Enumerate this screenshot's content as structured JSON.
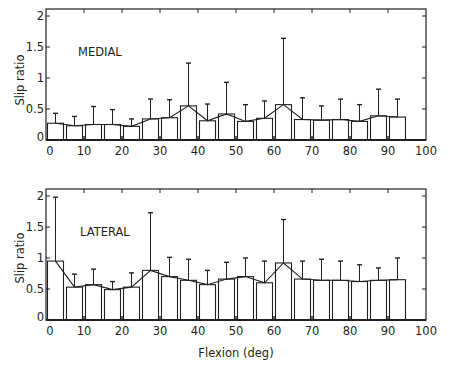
{
  "figure": {
    "xlabel": "Flexion (deg)"
  },
  "chart_data": [
    {
      "type": "bar",
      "panel_label": "MEDIAL",
      "title": "",
      "xlabel": "",
      "ylabel": "Slip ratio",
      "xlim": [
        0,
        100
      ],
      "ylim": [
        0,
        2
      ],
      "xticks": [
        "0",
        "10",
        "20",
        "30",
        "40",
        "50",
        "60",
        "70",
        "80",
        "90",
        "100"
      ],
      "yticks": [
        "0",
        "0.5",
        "1",
        "1.5",
        "2"
      ],
      "grid": false,
      "legend": null,
      "bin_width_deg": 5,
      "categories": [
        "0-5",
        "5-10",
        "10-15",
        "15-20",
        "20-25",
        "25-30",
        "30-35",
        "35-40",
        "40-45",
        "45-50",
        "50-55",
        "55-60",
        "60-65",
        "65-70",
        "70-75",
        "75-80",
        "80-85",
        "85-90",
        "90-95"
      ],
      "x_centers": [
        2.5,
        7.5,
        12.5,
        17.5,
        22.5,
        27.5,
        32.5,
        37.5,
        42.5,
        47.5,
        52.5,
        57.5,
        62.5,
        67.5,
        72.5,
        77.5,
        82.5,
        87.5,
        92.5
      ],
      "series": [
        {
          "name": "mean",
          "values": [
            0.27,
            0.23,
            0.25,
            0.25,
            0.22,
            0.34,
            0.36,
            0.55,
            0.31,
            0.42,
            0.3,
            0.35,
            0.57,
            0.33,
            0.32,
            0.33,
            0.3,
            0.39,
            0.37
          ]
        },
        {
          "name": "mean_plus_sd",
          "values": [
            0.43,
            0.38,
            0.54,
            0.49,
            0.34,
            0.66,
            0.65,
            1.24,
            0.58,
            0.93,
            0.57,
            0.63,
            1.64,
            0.68,
            0.55,
            0.66,
            0.57,
            0.82,
            0.66
          ]
        }
      ],
      "overlay": "line connecting bar-top means"
    },
    {
      "type": "bar",
      "panel_label": "LATERAL",
      "title": "",
      "xlabel": "Flexion (deg)",
      "ylabel": "Slip ratio",
      "xlim": [
        0,
        100
      ],
      "ylim": [
        0,
        2
      ],
      "xticks": [
        "0",
        "10",
        "20",
        "30",
        "40",
        "50",
        "60",
        "70",
        "80",
        "90",
        "100"
      ],
      "yticks": [
        "0",
        "0.5",
        "1",
        "1.5",
        "2"
      ],
      "grid": false,
      "legend": null,
      "bin_width_deg": 5,
      "categories": [
        "0-5",
        "5-10",
        "10-15",
        "15-20",
        "20-25",
        "25-30",
        "30-35",
        "35-40",
        "40-45",
        "45-50",
        "50-55",
        "55-60",
        "60-65",
        "65-70",
        "70-75",
        "75-80",
        "80-85",
        "85-90",
        "90-95"
      ],
      "x_centers": [
        2.5,
        7.5,
        12.5,
        17.5,
        22.5,
        27.5,
        32.5,
        37.5,
        42.5,
        47.5,
        52.5,
        57.5,
        62.5,
        67.5,
        72.5,
        77.5,
        82.5,
        87.5,
        92.5
      ],
      "series": [
        {
          "name": "mean",
          "values": [
            0.95,
            0.53,
            0.57,
            0.49,
            0.53,
            0.8,
            0.7,
            0.64,
            0.57,
            0.66,
            0.7,
            0.6,
            0.92,
            0.66,
            0.64,
            0.64,
            0.62,
            0.64,
            0.65
          ]
        },
        {
          "name": "mean_plus_sd",
          "values": [
            1.98,
            0.74,
            0.82,
            0.62,
            0.76,
            1.73,
            1.01,
            0.98,
            0.8,
            0.93,
            1.0,
            0.95,
            1.62,
            0.95,
            0.98,
            0.95,
            0.89,
            0.84,
            1.0
          ]
        }
      ],
      "overlay": "line connecting bar-top means"
    }
  ]
}
